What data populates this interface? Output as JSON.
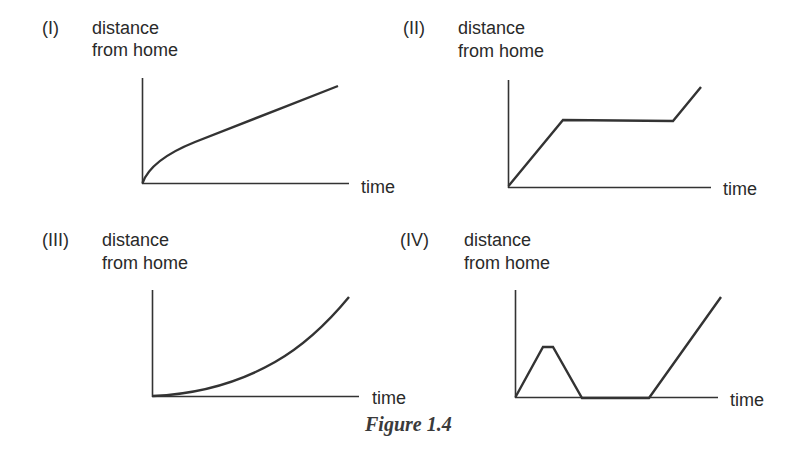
{
  "figure": {
    "caption": "Figure 1.4",
    "graphs": [
      {
        "id": "I",
        "number": "(I)",
        "ylabel_line1": "distance",
        "ylabel_line2": "from home",
        "xlabel": "time",
        "shape": "concave increasing curve (decelerating)"
      },
      {
        "id": "II",
        "number": "(II)",
        "ylabel_line1": "distance",
        "ylabel_line2": "from home",
        "xlabel": "time",
        "shape": "linear rise, flat plateau, linear rise"
      },
      {
        "id": "III",
        "number": "(III)",
        "ylabel_line1": "distance",
        "ylabel_line2": "from home",
        "xlabel": "time",
        "shape": "convex increasing curve (accelerating)"
      },
      {
        "id": "IV",
        "number": "(IV)",
        "ylabel_line1": "distance",
        "ylabel_line2": "from home",
        "xlabel": "time",
        "shape": "rise, short plateau, return to zero, flat at zero, steep rise"
      }
    ]
  },
  "colors": {
    "line": "#333333",
    "text": "#2a2a2a",
    "background": "#ffffff"
  }
}
